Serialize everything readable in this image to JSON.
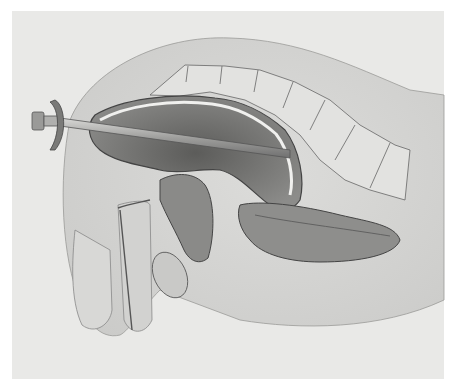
{
  "image": {
    "subject": "anatomical-cross-section-illustration",
    "style": "grayscale",
    "colors": {
      "border": "#ffffff",
      "background": "#e9e9e7",
      "tissue_light": "#d6d6d4",
      "tissue_mid": "#b9b9b7",
      "cavity_dark": "#6e6e6c",
      "outline": "#555555",
      "instrument": "#a8a8a6"
    }
  }
}
